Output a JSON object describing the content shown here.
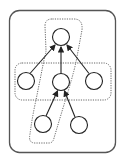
{
  "diagram": {
    "width": 123,
    "height": 162,
    "colors": {
      "background": "#ffffff",
      "stroke": "#222222",
      "outer_box": "#555555",
      "dotted": "#666666"
    },
    "nodes": [
      {
        "id": "top",
        "cx": 61,
        "cy": 37,
        "r": 8.5
      },
      {
        "id": "mid-left",
        "cx": 26,
        "cy": 81,
        "r": 8.5
      },
      {
        "id": "mid-center",
        "cx": 61,
        "cy": 82,
        "r": 8.5
      },
      {
        "id": "mid-right",
        "cx": 94,
        "cy": 81,
        "r": 8.5
      },
      {
        "id": "bottom-left",
        "cx": 43,
        "cy": 124,
        "r": 8.5
      },
      {
        "id": "bottom-right",
        "cx": 79,
        "cy": 125,
        "r": 8.5
      }
    ],
    "edges": [
      {
        "from": "mid-left",
        "to": "top"
      },
      {
        "from": "mid-center",
        "to": "top"
      },
      {
        "from": "mid-right",
        "to": "top"
      },
      {
        "from": "bottom-left",
        "to": "mid-center"
      },
      {
        "from": "bottom-right",
        "to": "mid-center"
      }
    ],
    "groups": [
      {
        "id": "outer-box",
        "style": "solid"
      },
      {
        "id": "horizontal-group",
        "style": "dotted",
        "members": [
          "mid-left",
          "mid-center",
          "mid-right"
        ]
      },
      {
        "id": "vertical-group",
        "style": "dotted",
        "members": [
          "top",
          "mid-center",
          "bottom-left"
        ]
      }
    ]
  }
}
